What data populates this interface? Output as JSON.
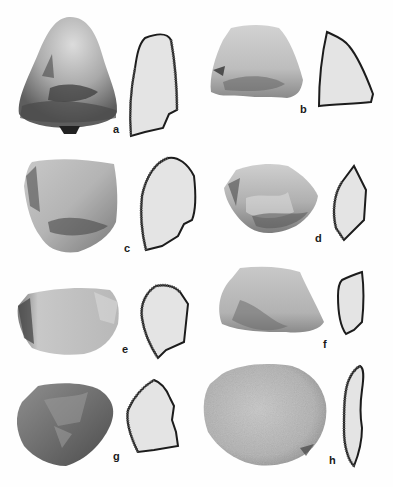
{
  "figure": {
    "type": "archaeological artifact plate",
    "colors": {
      "background": "#ffffff",
      "profile_fill": "#e4e4e4",
      "profile_stroke": "#1c1c1c",
      "label": "#1a1a1a"
    },
    "artifacts": [
      {
        "id": "a",
        "label": "a"
      },
      {
        "id": "b",
        "label": "b"
      },
      {
        "id": "c",
        "label": "c"
      },
      {
        "id": "d",
        "label": "d"
      },
      {
        "id": "e",
        "label": "e"
      },
      {
        "id": "f",
        "label": "f"
      },
      {
        "id": "g",
        "label": "g"
      },
      {
        "id": "h",
        "label": "h"
      }
    ]
  }
}
